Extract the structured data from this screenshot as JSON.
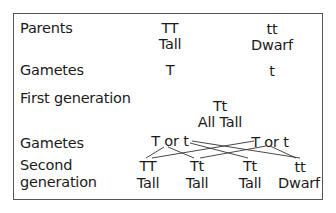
{
  "diagram": {
    "rows": {
      "parents": {
        "label": "Parents",
        "left": {
          "genotype": "TT",
          "phenotype": "Tall"
        },
        "right": {
          "genotype": "tt",
          "phenotype": "Dwarf"
        }
      },
      "gametes1": {
        "label": "Gametes",
        "left": "T",
        "right": "t"
      },
      "first_generation": {
        "label": "First generation",
        "genotype": "Tt",
        "phenotype": "All Tall"
      },
      "gametes2": {
        "label": "Gametes",
        "left": "T or t",
        "right": "T or t"
      },
      "second_generation": {
        "label_line1": "Second",
        "label_line2": "generation",
        "offspring": [
          {
            "genotype": "TT",
            "phenotype": "Tall"
          },
          {
            "genotype": "Tt",
            "phenotype": "Tall"
          },
          {
            "genotype": "Tt",
            "phenotype": "Tall"
          },
          {
            "genotype": "tt",
            "phenotype": "Dwarf"
          }
        ]
      }
    },
    "colors": {
      "border": "#555555",
      "text": "#1a1a1a",
      "lines": "#333333"
    }
  }
}
